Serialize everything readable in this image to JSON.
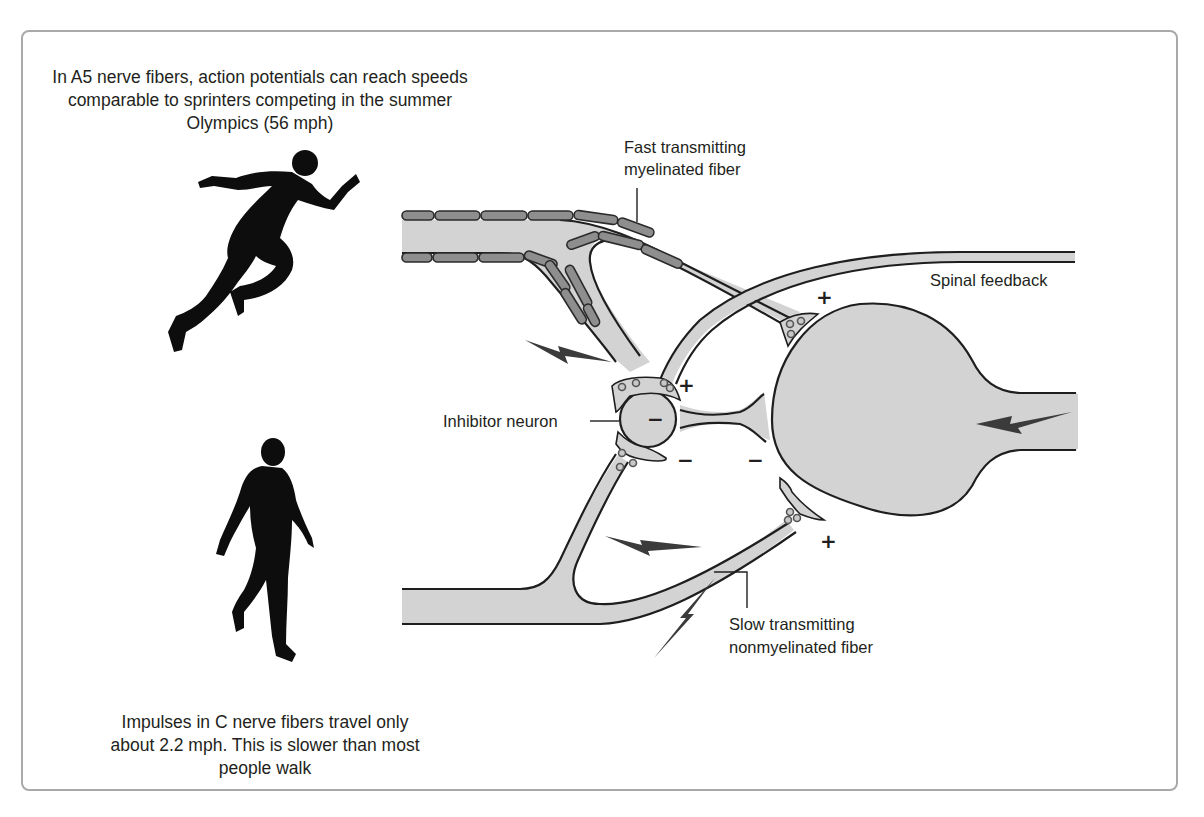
{
  "captions": {
    "top": "In A5 nerve fibers, action potentials can reach speeds comparable to sprinters competing in the summer Olympics (56 mph)",
    "bottom": "Impulses in C nerve fibers travel only about 2.2 mph. This is slower than most people walk"
  },
  "labels": {
    "fast_fiber_line1": "Fast transmitting",
    "fast_fiber_line2": "myelinated fiber",
    "spinal_feedback": "Spinal feedback",
    "inhibitor_neuron": "Inhibitor neuron",
    "slow_fiber_line1": "Slow transmitting",
    "slow_fiber_line2": "nonmyelinated fiber"
  },
  "signs": {
    "top_synapse": "+",
    "inhibitor_input": "+",
    "inhibitor_soma": "−",
    "inhibitor_lower": "−",
    "inhibitor_output": "−",
    "bottom_synapse": "+"
  },
  "icons": {
    "sprinter": "sprinter-silhouette",
    "walker": "walker-silhouette",
    "impulse": "lightning-bolt"
  },
  "colors": {
    "axoplasm": "#d3d3d3",
    "myelin": "#8e8e8e",
    "outline": "#1e1e1e",
    "bolt": "#3b3b3b",
    "frame": "#a9a9a9"
  }
}
